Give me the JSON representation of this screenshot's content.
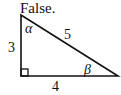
{
  "answer": {
    "text": "False."
  },
  "triangle": {
    "type": "right-triangle",
    "vertices": {
      "top": [
        21,
        15
      ],
      "right_angle": [
        21,
        76
      ],
      "right": [
        118,
        76
      ]
    },
    "sides": {
      "vertical_leg": "3",
      "horizontal_leg": "4",
      "hypotenuse": "5"
    },
    "angles": {
      "top": "α",
      "right": "β"
    },
    "stroke_color": "#111111"
  }
}
